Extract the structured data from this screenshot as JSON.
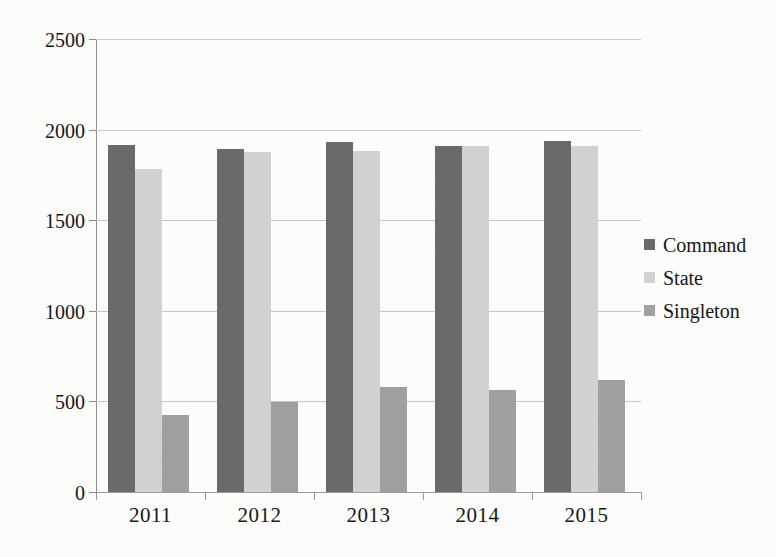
{
  "chart_data": {
    "type": "bar",
    "title": "",
    "subtitle": "",
    "xlabel": "",
    "ylabel": "",
    "categories": [
      "2011",
      "2012",
      "2013",
      "2014",
      "2015"
    ],
    "series": [
      {
        "name": "Command",
        "color": "#6a6a6a",
        "values": [
          1915,
          1893,
          1930,
          1910,
          1940
        ]
      },
      {
        "name": "State",
        "color": "#d2d2d2",
        "values": [
          1783,
          1876,
          1880,
          1910,
          1910
        ]
      },
      {
        "name": "Singleton",
        "color": "#a0a0a0",
        "values": [
          425,
          497,
          580,
          565,
          620
        ]
      }
    ],
    "ylim": [
      0,
      2500
    ],
    "y_ticks": [
      0,
      500,
      1000,
      1500,
      2000,
      2500
    ],
    "y_tick_labels": [
      "0",
      "500",
      "1000",
      "1500",
      "2000",
      "2500"
    ],
    "grid": "horizontal",
    "legend_position": "right",
    "annotations": []
  },
  "legend": {
    "items": [
      {
        "label": "Command",
        "swatch": "legend-swatch-command"
      },
      {
        "label": "State",
        "swatch": "legend-swatch-state"
      },
      {
        "label": "Singleton",
        "swatch": "legend-swatch-singleton"
      }
    ]
  },
  "axes": {
    "y_tick_labels": [
      "2500",
      "2000",
      "1500",
      "1000",
      "500",
      "0"
    ],
    "x_tick_labels": [
      "2011",
      "2012",
      "2013",
      "2014",
      "2015"
    ]
  }
}
